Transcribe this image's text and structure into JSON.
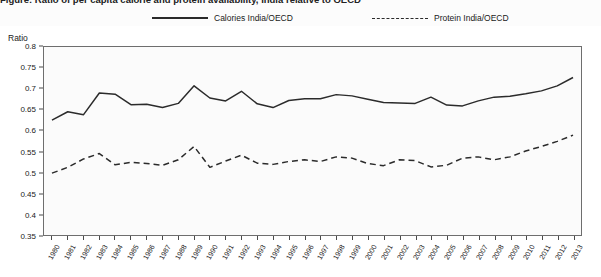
{
  "figure": {
    "title": "Figure: Ratio of per capita calorie and protein availability, India relative to OECD",
    "y_axis_title": "Ratio"
  },
  "legend": {
    "position": "top",
    "items": [
      {
        "label": "Calories India/OECD",
        "style": "solid",
        "color": "#2b2b2b",
        "icon": "solid-line-swatch"
      },
      {
        "label": "Protein India/OECD",
        "style": "dashed",
        "color": "#2b2b2b",
        "icon": "dashed-line-swatch"
      }
    ]
  },
  "chart_data": {
    "type": "line",
    "title": "Ratio of per capita calorie and protein availability, India relative to OECD",
    "xlabel": "",
    "ylabel": "Ratio",
    "ylim": [
      0.35,
      0.8
    ],
    "ytick_step": 0.05,
    "yticks": [
      "0.8",
      "0.75",
      "0.7",
      "0.65",
      "0.6",
      "0.55",
      "0.5",
      "0.45",
      "0.4",
      "0.35"
    ],
    "grid": false,
    "legend_position": "top",
    "x": [
      1980,
      1981,
      1982,
      1983,
      1984,
      1985,
      1986,
      1987,
      1988,
      1989,
      1990,
      1991,
      1992,
      1993,
      1994,
      1995,
      1996,
      1997,
      1998,
      1999,
      2000,
      2001,
      2002,
      2003,
      2004,
      2005,
      2006,
      2007,
      2008,
      2009,
      2010,
      2011,
      2012,
      2013
    ],
    "series": [
      {
        "name": "Calories India/OECD",
        "style": "solid",
        "color": "#2b2b2b",
        "values": [
          0.625,
          0.645,
          0.638,
          0.69,
          0.687,
          0.662,
          0.663,
          0.655,
          0.665,
          0.707,
          0.678,
          0.671,
          0.694,
          0.664,
          0.655,
          0.672,
          0.676,
          0.676,
          0.686,
          0.683,
          0.675,
          0.667,
          0.666,
          0.665,
          0.68,
          0.661,
          0.659,
          0.671,
          0.68,
          0.682,
          0.688,
          0.695,
          0.707,
          0.727
        ]
      },
      {
        "name": "Protein India/OECD",
        "style": "dashed",
        "color": "#2b2b2b",
        "values": [
          0.498,
          0.512,
          0.532,
          0.545,
          0.518,
          0.524,
          0.521,
          0.517,
          0.53,
          0.562,
          0.512,
          0.527,
          0.541,
          0.522,
          0.519,
          0.526,
          0.53,
          0.526,
          0.537,
          0.534,
          0.521,
          0.516,
          0.53,
          0.528,
          0.513,
          0.517,
          0.534,
          0.537,
          0.53,
          0.537,
          0.551,
          0.562,
          0.574,
          0.589
        ]
      }
    ]
  }
}
